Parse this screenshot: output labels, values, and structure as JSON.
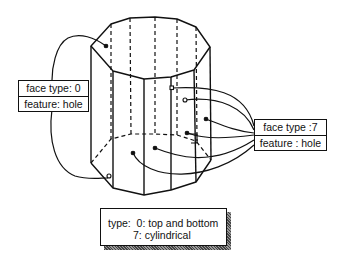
{
  "diagram": {
    "left_label": {
      "face_type": "face type: 0",
      "feature": "feature: hole"
    },
    "right_label": {
      "face_type": "face type :7",
      "feature": "feature : hole"
    },
    "legend": {
      "line1": "type:  0: top and bottom",
      "line2": "7: cylindrical"
    },
    "colors": {
      "line": "#111111",
      "background": "#ffffff"
    }
  }
}
